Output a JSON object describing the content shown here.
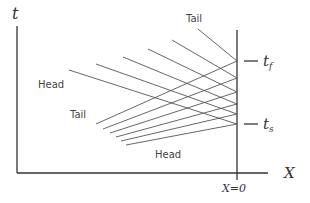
{
  "diagram": {
    "axis_t_label": "t",
    "axis_x_label": "X",
    "origin_label": "X=0",
    "tf_label": "t",
    "tf_sub": "f",
    "ts_label": "t",
    "ts_sub": "s",
    "labels": {
      "tail_top": "Tail",
      "head_upper": "Head",
      "tail_middle": "Tail",
      "head_lower": "Head"
    }
  }
}
